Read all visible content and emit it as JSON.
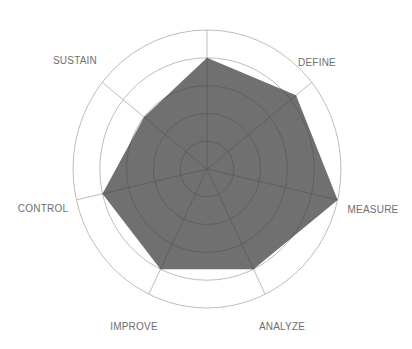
{
  "chart_data": {
    "type": "radar",
    "title": "",
    "categories": [
      "",
      "DEFINE",
      "MEASURE",
      "ANALYZE",
      "IMPROVE",
      "CONTROL",
      "SUSTAIN"
    ],
    "series": [
      {
        "name": "Score",
        "values": [
          0.8,
          0.85,
          1.0,
          0.8,
          0.8,
          0.8,
          0.6
        ]
      }
    ],
    "rings": [
      0.2,
      0.4,
      0.6,
      0.8,
      1.0
    ],
    "range": [
      0,
      1
    ],
    "grid": true,
    "legend": "none",
    "colors": {
      "fill": "#707070",
      "ring": "#bdbdbd",
      "inner_grid": "#5a5a5a",
      "label": "#6e6e6e"
    }
  },
  "labels": {
    "define": "DEFINE",
    "measure": "MEASURE",
    "analyze": "ANALYZE",
    "improve": "IMPROVE",
    "control": "CONTROL",
    "sustain": "SUSTAIN"
  }
}
